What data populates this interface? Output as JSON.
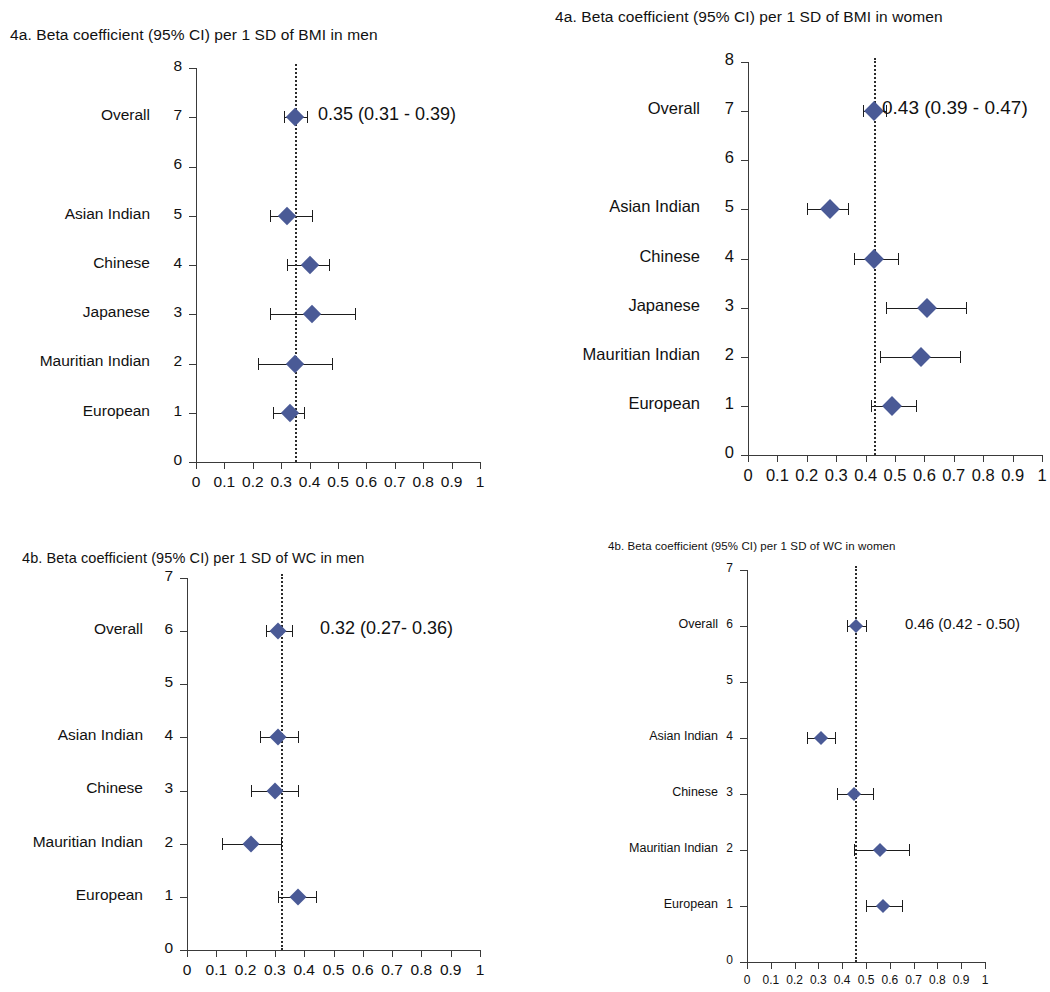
{
  "figure": {
    "marker_color": "#4A5A96",
    "line_color": "#1d1d1d",
    "axis_color": "#3a3a3a"
  },
  "panels": [
    {
      "id": "bmi-men",
      "title": "4a. Beta coefficient (95% CI) per 1 SD of BMI in men",
      "chart_data": {
        "type": "scatter",
        "title": "4a. Beta coefficient (95% CI) per 1 SD of BMI in men",
        "xlabel": "",
        "ylabel": "",
        "xlim": [
          0,
          1
        ],
        "ylim": [
          0,
          8
        ],
        "xticks": [
          "0",
          "0.1",
          "0.2",
          "0.3",
          "0.4",
          "0.5",
          "0.6",
          "0.7",
          "0.8",
          "0.9",
          "1"
        ],
        "yticks": [
          "0",
          "1",
          "2",
          "3",
          "4",
          "5",
          "6",
          "7",
          "8"
        ],
        "grid": false,
        "legend": "none",
        "reference_line": 0.35,
        "annotation": "0.35 (0.31 - 0.39)",
        "annotation_row": 7,
        "categories": [
          "Overall",
          "Asian Indian",
          "Chinese",
          "Japanese",
          "Mauritian Indian",
          "European"
        ],
        "rows": [
          {
            "label": "Overall",
            "y": 7,
            "estimate": 0.35,
            "low": 0.31,
            "high": 0.39
          },
          {
            "label": "Asian Indian",
            "y": 5,
            "estimate": 0.32,
            "low": 0.26,
            "high": 0.41
          },
          {
            "label": "Chinese",
            "y": 4,
            "estimate": 0.4,
            "low": 0.32,
            "high": 0.47
          },
          {
            "label": "Japanese",
            "y": 3,
            "estimate": 0.41,
            "low": 0.26,
            "high": 0.56
          },
          {
            "label": "Mauritian Indian",
            "y": 2,
            "estimate": 0.35,
            "low": 0.22,
            "high": 0.48
          },
          {
            "label": "European",
            "y": 1,
            "estimate": 0.33,
            "low": 0.27,
            "high": 0.38
          }
        ]
      }
    },
    {
      "id": "bmi-women",
      "title": "4a. Beta coefficient (95% CI) per 1 SD of BMI in women",
      "chart_data": {
        "type": "scatter",
        "title": "4a. Beta coefficient (95% CI) per 1 SD of BMI in women",
        "xlabel": "",
        "ylabel": "",
        "xlim": [
          0,
          1
        ],
        "ylim": [
          0,
          8
        ],
        "xticks": [
          "0",
          "0.1",
          "0.2",
          "0.3",
          "0.4",
          "0.5",
          "0.6",
          "0.7",
          "0.8",
          "0.9",
          "1"
        ],
        "yticks": [
          "0",
          "1",
          "2",
          "3",
          "4",
          "5",
          "6",
          "7",
          "8"
        ],
        "grid": false,
        "legend": "none",
        "reference_line": 0.43,
        "annotation": "0.43 (0.39 - 0.47)",
        "annotation_row": 7,
        "categories": [
          "Overall",
          "Asian Indian",
          "Chinese",
          "Japanese",
          "Mauritian Indian",
          "European"
        ],
        "rows": [
          {
            "label": "Overall",
            "y": 7,
            "estimate": 0.43,
            "low": 0.39,
            "high": 0.47
          },
          {
            "label": "Asian Indian",
            "y": 5,
            "estimate": 0.28,
            "low": 0.2,
            "high": 0.34
          },
          {
            "label": "Chinese",
            "y": 4,
            "estimate": 0.43,
            "low": 0.36,
            "high": 0.51
          },
          {
            "label": "Japanese",
            "y": 3,
            "estimate": 0.61,
            "low": 0.47,
            "high": 0.74
          },
          {
            "label": "Mauritian Indian",
            "y": 2,
            "estimate": 0.59,
            "low": 0.45,
            "high": 0.72
          },
          {
            "label": "European",
            "y": 1,
            "estimate": 0.49,
            "low": 0.42,
            "high": 0.57
          }
        ]
      }
    },
    {
      "id": "wc-men",
      "title": "4b. Beta coefficient (95% CI) per 1 SD of WC in men",
      "chart_data": {
        "type": "scatter",
        "title": "4b. Beta coefficient (95% CI) per 1 SD of WC in men",
        "xlabel": "",
        "ylabel": "",
        "xlim": [
          0,
          1
        ],
        "ylim": [
          0,
          7
        ],
        "xticks": [
          "0",
          "0.1",
          "0.2",
          "0.3",
          "0.4",
          "0.5",
          "0.6",
          "0.7",
          "0.8",
          "0.9",
          "1"
        ],
        "yticks": [
          "0",
          "1",
          "2",
          "3",
          "4",
          "5",
          "6",
          "7"
        ],
        "grid": false,
        "legend": "none",
        "reference_line": 0.32,
        "annotation": "0.32 (0.27- 0.36)",
        "annotation_row": 6,
        "categories": [
          "Overall",
          "Asian Indian",
          "Chinese",
          "Mauritian Indian",
          "European"
        ],
        "rows": [
          {
            "label": "Overall",
            "y": 6,
            "estimate": 0.31,
            "low": 0.27,
            "high": 0.36
          },
          {
            "label": "Asian Indian",
            "y": 4,
            "estimate": 0.31,
            "low": 0.25,
            "high": 0.38
          },
          {
            "label": "Chinese",
            "y": 3,
            "estimate": 0.3,
            "low": 0.22,
            "high": 0.38
          },
          {
            "label": "Mauritian Indian",
            "y": 2,
            "estimate": 0.22,
            "low": 0.12,
            "high": 0.32
          },
          {
            "label": "European",
            "y": 1,
            "estimate": 0.38,
            "low": 0.31,
            "high": 0.44
          }
        ]
      }
    },
    {
      "id": "wc-women",
      "title": "4b. Beta coefficient (95% CI) per 1 SD of WC in women",
      "chart_data": {
        "type": "scatter",
        "title": "4b. Beta coefficient (95% CI) per 1 SD of WC in women",
        "xlabel": "",
        "ylabel": "",
        "xlim": [
          0,
          1
        ],
        "ylim": [
          0,
          7
        ],
        "xticks": [
          "0",
          "0.1",
          "0.2",
          "0.3",
          "0.4",
          "0.5",
          "0.6",
          "0.7",
          "0.8",
          "0.9",
          "1"
        ],
        "yticks": [
          "0",
          "1",
          "2",
          "3",
          "4",
          "5",
          "6",
          "7"
        ],
        "grid": false,
        "legend": "none",
        "reference_line": 0.455,
        "annotation": "0.46 (0.42 - 0.50)",
        "annotation_row": 6,
        "categories": [
          "Overall",
          "Asian Indian",
          "Chinese",
          "Mauritian Indian",
          "European"
        ],
        "rows": [
          {
            "label": "Overall",
            "y": 6,
            "estimate": 0.46,
            "low": 0.42,
            "high": 0.5
          },
          {
            "label": "Asian Indian",
            "y": 4,
            "estimate": 0.31,
            "low": 0.25,
            "high": 0.37
          },
          {
            "label": "Chinese",
            "y": 3,
            "estimate": 0.45,
            "low": 0.38,
            "high": 0.53
          },
          {
            "label": "Mauritian Indian",
            "y": 2,
            "estimate": 0.56,
            "low": 0.45,
            "high": 0.68
          },
          {
            "label": "European",
            "y": 1,
            "estimate": 0.57,
            "low": 0.5,
            "high": 0.65
          }
        ]
      }
    }
  ]
}
